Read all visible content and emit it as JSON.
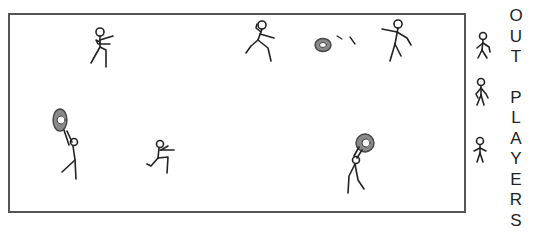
{
  "diagram": {
    "type": "dodgeball court illustration",
    "court": {
      "border_color": "#555555"
    },
    "ball_color": "#8a8a8a",
    "side_label": {
      "word1": [
        "O",
        "U",
        "T"
      ],
      "word2": [
        "P",
        "L",
        "A",
        "Y",
        "E",
        "R",
        "S"
      ]
    },
    "figures": [
      {
        "id": "player-1",
        "role": "thrower",
        "location": "top-left"
      },
      {
        "id": "player-2",
        "role": "runner",
        "location": "top-center"
      },
      {
        "id": "ball-in-flight",
        "role": "ball",
        "location": "top-right-center"
      },
      {
        "id": "player-3",
        "role": "dodger",
        "location": "top-right"
      },
      {
        "id": "player-4",
        "role": "catcher-holding-ball",
        "location": "bottom-left"
      },
      {
        "id": "player-5",
        "role": "runner",
        "location": "bottom-center-left"
      },
      {
        "id": "player-6",
        "role": "catcher-holding-ball",
        "location": "bottom-right"
      },
      {
        "id": "out-player-1",
        "role": "out",
        "location": "sideline"
      },
      {
        "id": "out-player-2",
        "role": "out",
        "location": "sideline"
      },
      {
        "id": "out-player-3",
        "role": "out",
        "location": "sideline"
      }
    ]
  }
}
